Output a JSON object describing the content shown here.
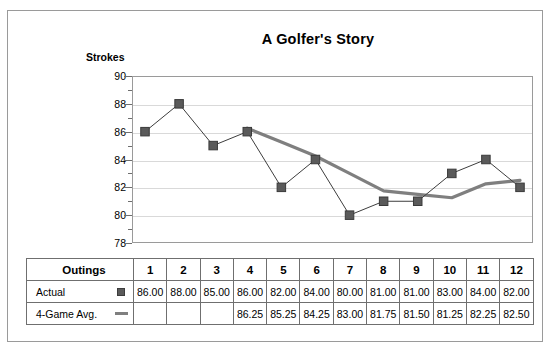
{
  "chart_data": {
    "type": "line",
    "title": "A Golfer's Story",
    "ylabel": "Strokes",
    "xlabel": "",
    "ylim": [
      78,
      90
    ],
    "ytick_labels": [
      "90",
      "88",
      "86",
      "84",
      "82",
      "80",
      "78"
    ],
    "ytick_values": [
      90,
      88,
      86,
      84,
      82,
      80,
      78
    ],
    "ytick_step": 2,
    "minor_tick_step": 1,
    "grid": "horizontal",
    "legend_position": "table",
    "categories": [
      "1",
      "2",
      "3",
      "4",
      "5",
      "6",
      "7",
      "8",
      "9",
      "10",
      "11",
      "12"
    ],
    "series": [
      {
        "name": "Actual",
        "marker": "square",
        "color": "#5a5a5a",
        "values": [
          86.0,
          88.0,
          85.0,
          86.0,
          82.0,
          84.0,
          80.0,
          81.0,
          81.0,
          83.0,
          84.0,
          82.0
        ],
        "labels": [
          "86.00",
          "88.00",
          "85.00",
          "86.00",
          "82.00",
          "84.00",
          "80.00",
          "81.00",
          "81.00",
          "83.00",
          "84.00",
          "82.00"
        ]
      },
      {
        "name": "4-Game Avg.",
        "marker": "line",
        "color": "#7f7f7f",
        "values": [
          null,
          null,
          null,
          86.25,
          85.25,
          84.25,
          83.0,
          81.75,
          81.5,
          81.25,
          82.25,
          82.5
        ],
        "labels": [
          "",
          "",
          "",
          "86.25",
          "85.25",
          "84.25",
          "83.00",
          "81.75",
          "81.50",
          "81.25",
          "82.25",
          "82.50"
        ]
      }
    ]
  },
  "table": {
    "header_label": "Outings",
    "columns": [
      "1",
      "2",
      "3",
      "4",
      "5",
      "6",
      "7",
      "8",
      "9",
      "10",
      "11",
      "12"
    ],
    "rows": [
      {
        "label": "Actual",
        "marker": "square-marker-icon",
        "cells": [
          "86.00",
          "88.00",
          "85.00",
          "86.00",
          "82.00",
          "84.00",
          "80.00",
          "81.00",
          "81.00",
          "83.00",
          "84.00",
          "82.00"
        ]
      },
      {
        "label": "4-Game Avg.",
        "marker": "line-marker-icon",
        "cells": [
          "",
          "",
          "",
          "86.25",
          "85.25",
          "84.25",
          "83.00",
          "81.75",
          "81.50",
          "81.25",
          "82.25",
          "82.50"
        ]
      }
    ]
  },
  "colors": {
    "actual": "#5a5a5a",
    "average": "#7f7f7f",
    "grid": "#d9d9d9",
    "border": "#6f6f6f"
  }
}
